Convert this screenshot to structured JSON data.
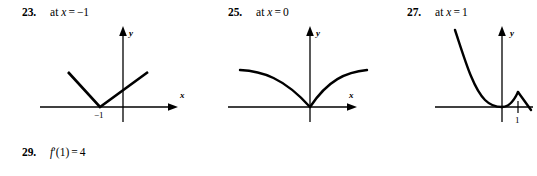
{
  "page": {
    "background_color": "#ffffff",
    "ink_color": "#000000"
  },
  "items": [
    {
      "number": "23.",
      "prompt_prefix": "at",
      "prompt_var": "x",
      "prompt_op": "=",
      "prompt_value": "−1",
      "graph": {
        "x_axis_label": "x",
        "y_axis_label": "y",
        "tick_labels": [
          "−1"
        ],
        "description": "V-shaped absolute-value graph with vertex on the x-axis at x = -1"
      }
    },
    {
      "number": "25.",
      "prompt_prefix": "at",
      "prompt_var": "x",
      "prompt_op": "=",
      "prompt_value": "0",
      "graph": {
        "x_axis_label": "x",
        "y_axis_label": "y",
        "tick_labels": [],
        "description": "Cusp at the origin; two concave-down branches rising to the left and right"
      }
    },
    {
      "number": "27.",
      "prompt_prefix": "at",
      "prompt_var": "x",
      "prompt_op": "=",
      "prompt_value": "1",
      "graph": {
        "x_axis_label": "x",
        "y_axis_label": "y",
        "tick_labels": [
          "1"
        ],
        "description": "Steeply decreasing curve touching the x-axis at the origin, then a triangular peak with corner at x = 1"
      }
    }
  ],
  "footer_item": {
    "number": "29.",
    "answer_fn": "f",
    "answer_prime": "′",
    "answer_arg": "(1)",
    "answer_op": "=",
    "answer_value": "4"
  }
}
